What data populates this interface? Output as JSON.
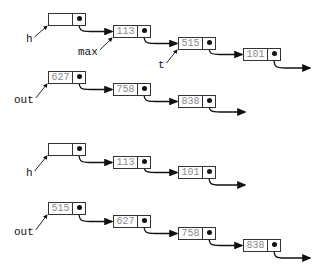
{
  "diagrams": [
    {
      "id": "before",
      "lists": [
        {
          "name": "h-list",
          "nodes": [
            {
              "value": "",
              "x": 48,
              "y": 13
            },
            {
              "value": "113",
              "x": 113,
              "y": 25
            },
            {
              "value": "515",
              "x": 178,
              "y": 37
            },
            {
              "value": "101",
              "x": 243,
              "y": 48
            }
          ],
          "tail_arrow_end": [
            310,
            68
          ]
        },
        {
          "name": "out-list",
          "nodes": [
            {
              "value": "627",
              "x": 48,
              "y": 71
            },
            {
              "value": "758",
              "x": 113,
              "y": 83
            },
            {
              "value": "838",
              "x": 178,
              "y": 95
            }
          ],
          "tail_arrow_end": [
            245,
            112
          ]
        }
      ],
      "labels": [
        {
          "text": "h",
          "x": 26,
          "y": 33,
          "points_to": [
            48,
            26
          ]
        },
        {
          "text": "max",
          "x": 78,
          "y": 46,
          "points_to": [
            113,
            38
          ]
        },
        {
          "text": "t",
          "x": 158,
          "y": 59,
          "points_to": [
            178,
            50
          ]
        },
        {
          "text": "out",
          "x": 14,
          "y": 94,
          "points_to": [
            48,
            84
          ]
        }
      ]
    },
    {
      "id": "after",
      "lists": [
        {
          "name": "h-list",
          "nodes": [
            {
              "value": "",
              "x": 48,
              "y": 143
            },
            {
              "value": "113",
              "x": 113,
              "y": 156
            },
            {
              "value": "101",
              "x": 178,
              "y": 166
            }
          ],
          "tail_arrow_end": [
            245,
            185
          ]
        },
        {
          "name": "out-list",
          "nodes": [
            {
              "value": "515",
              "x": 48,
              "y": 202
            },
            {
              "value": "627",
              "x": 113,
              "y": 215
            },
            {
              "value": "758",
              "x": 178,
              "y": 227
            },
            {
              "value": "838",
              "x": 243,
              "y": 239
            }
          ],
          "tail_arrow_end": [
            310,
            258
          ]
        }
      ],
      "labels": [
        {
          "text": "h",
          "x": 26,
          "y": 167,
          "points_to": [
            48,
            156
          ]
        },
        {
          "text": "out",
          "x": 14,
          "y": 226,
          "points_to": [
            48,
            215
          ]
        }
      ]
    }
  ],
  "colors": {
    "line": "#111111",
    "value_text": "#8a8a8a",
    "box_border": "#333333"
  }
}
